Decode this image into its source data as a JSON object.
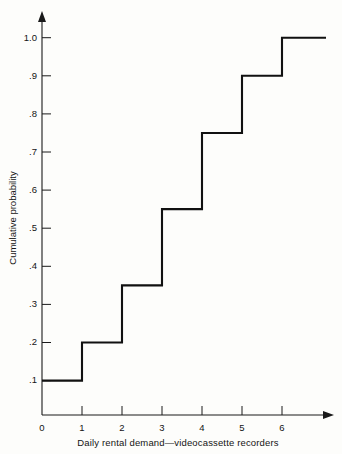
{
  "chart_data": {
    "type": "line",
    "subtype": "step-cumulative-distribution",
    "title": "",
    "xlabel": "Daily rental demand—videocassette recorders",
    "ylabel": "Cumulative probability",
    "x": [
      0,
      1,
      2,
      3,
      4,
      5,
      6
    ],
    "values": [
      0.1,
      0.2,
      0.35,
      0.55,
      0.75,
      0.9,
      1.0
    ],
    "series": [
      {
        "name": "Cumulative probability",
        "step_style": "post",
        "points": [
          {
            "x": 0,
            "y": 0.1
          },
          {
            "x": 1,
            "y": 0.2
          },
          {
            "x": 2,
            "y": 0.35
          },
          {
            "x": 3,
            "y": 0.55
          },
          {
            "x": 4,
            "y": 0.75
          },
          {
            "x": 5,
            "y": 0.9
          },
          {
            "x": 6,
            "y": 1.0
          }
        ]
      }
    ],
    "xlim": [
      0,
      7
    ],
    "ylim": [
      0,
      1.05
    ],
    "xticks": [
      0,
      1,
      2,
      3,
      4,
      5,
      6
    ],
    "xticklabels": [
      "0",
      "1",
      "2",
      "3",
      "4",
      "5",
      "6"
    ],
    "yticks": [
      0.1,
      0.2,
      0.3,
      0.4,
      0.5,
      0.6,
      0.7,
      0.8,
      0.9,
      1.0
    ],
    "yticklabels": [
      ".1",
      ".2",
      ".3",
      ".4",
      ".5",
      ".6",
      ".7",
      ".8",
      ".9",
      "1.0"
    ],
    "grid": false,
    "legend": null,
    "legend_position": "none",
    "annotations": [],
    "line_color": "#111111",
    "axis_color": "#1a1a1a",
    "background_color": "#fdfdfb"
  },
  "figure": {
    "caption": "Daily rental demand—videocassette recorders",
    "y_axis_title": "Cumulative probability"
  }
}
